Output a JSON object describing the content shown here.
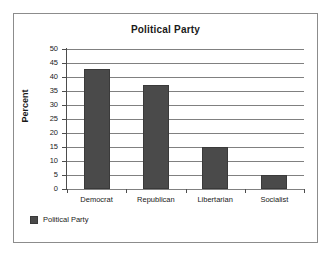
{
  "chart_data": {
    "type": "bar",
    "title": "Political Party",
    "categories": [
      "Democrat",
      "Republican",
      "Libertarian",
      "Socialist"
    ],
    "values": [
      43,
      37,
      15,
      5
    ],
    "series": [
      {
        "name": "Political Party",
        "values": [
          43,
          37,
          15,
          5
        ],
        "color": "#4a4a4a"
      }
    ],
    "xlabel": "",
    "ylabel": "Percent",
    "ylim": [
      0,
      50
    ],
    "ytick_step": 5,
    "yticks": [
      50,
      45,
      40,
      35,
      30,
      25,
      20,
      15,
      10,
      5,
      0
    ],
    "ytick_labels": [
      "50",
      "45",
      "40",
      "35",
      "30",
      "25",
      "20",
      "15",
      "10",
      "5",
      "0"
    ],
    "grid": true,
    "grid_axis": "y",
    "legend": {
      "position": "bottom-left",
      "entries": [
        {
          "label": "Political Party",
          "color": "#4a4a4a"
        }
      ]
    },
    "colors": {
      "bar": "#4a4a4a",
      "bar_edge": "#3a3a3a",
      "gridline": "#808080",
      "axis": "#4d4d4d",
      "frame_border": "#8c8c8c",
      "text": "#1a1a1a",
      "background": "#ffffff"
    }
  }
}
